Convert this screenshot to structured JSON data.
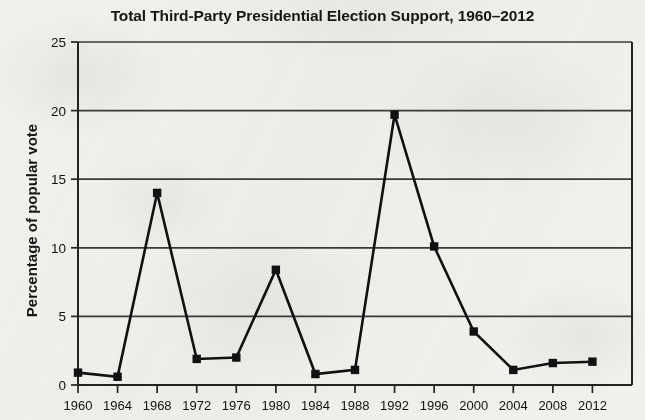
{
  "chart_data": {
    "type": "line",
    "title": "Total Third-Party Presidential Election Support, 1960–2012",
    "xlabel": "",
    "ylabel": "Percentage of popular vote",
    "categories": [
      "1960",
      "1964",
      "1968",
      "1972",
      "1976",
      "1980",
      "1984",
      "1988",
      "1992",
      "1996",
      "2000",
      "2004",
      "2008",
      "2012"
    ],
    "values": [
      0.9,
      0.6,
      14.0,
      1.9,
      2.0,
      8.4,
      0.8,
      1.1,
      19.7,
      10.1,
      3.9,
      1.1,
      1.6,
      1.7
    ],
    "ylim": [
      0,
      25
    ],
    "yticks": [
      0,
      5,
      10,
      15,
      20,
      25
    ],
    "ytick_labels": [
      "0",
      "5",
      "10",
      "15",
      "20",
      "25"
    ],
    "grid": "horizontal",
    "legend": "none",
    "marker": "square",
    "line_color": "#111111",
    "marker_color": "#111111",
    "grid_color": "#3a3a3a",
    "background_color": "#f2f1ee"
  }
}
